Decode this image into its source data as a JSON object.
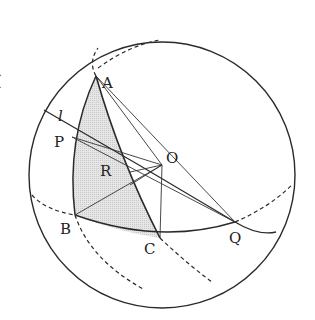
{
  "diagram": {
    "type": "sphere-geometry",
    "colors": {
      "stroke": "#2a2a2a",
      "shade": "#dcdcdc",
      "background": "#ffffff"
    },
    "labels": {
      "A": "A",
      "P": "P",
      "R": "R",
      "O": "O",
      "B": "B",
      "C": "C",
      "Q": "Q",
      "l": "l"
    },
    "points": {
      "A": [
        96,
        76
      ],
      "P": [
        72,
        137
      ],
      "R": [
        130,
        172
      ],
      "O": [
        162,
        165
      ],
      "B": [
        75,
        215
      ],
      "C": [
        160,
        238
      ],
      "Q": [
        235,
        222
      ]
    },
    "sphere": {
      "cx": 162,
      "cy": 175,
      "r": 133
    },
    "shaded_region": "spherical triangle ABC",
    "edge_mark": "("
  }
}
